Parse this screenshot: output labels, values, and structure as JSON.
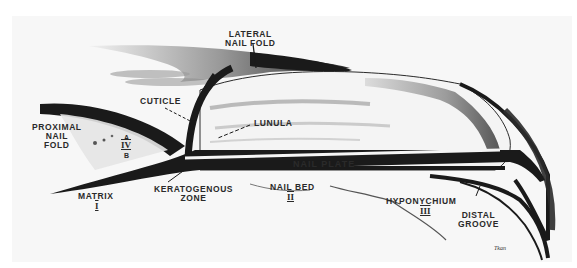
{
  "figure": {
    "colors": {
      "ink": "#1a1a1a",
      "shade": "#6b6b6b",
      "background": "#f7f7f7",
      "page": "#ffffff"
    }
  },
  "labels": {
    "lateral_nail_fold": [
      "LATERAL",
      "NAIL FOLD"
    ],
    "cuticle": "CUTICLE",
    "lunula": "LUNULA",
    "proximal_nail_fold": [
      "PROXIMAL",
      "NAIL",
      "FOLD"
    ],
    "proximal_nail_fold_zones": {
      "a": "A",
      "iv": "IV",
      "b": "B"
    },
    "nail_plate": "NAIL PLATE",
    "matrix": "MATRIX",
    "matrix_numeral": "I",
    "keratogenous_zone": [
      "KERATOGENOUS",
      "ZONE"
    ],
    "nail_bed": "NAIL BED",
    "nail_bed_numeral": "II",
    "hyponychium": "HYPONYCHIUM",
    "hyponychium_numeral": "III",
    "distal_groove": [
      "DISTAL",
      "GROOVE"
    ],
    "artist_signature": "Tkan"
  }
}
